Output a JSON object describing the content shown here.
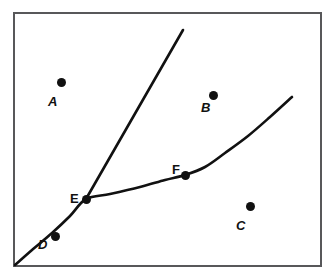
{
  "figure": {
    "name": "labeled-points-two-curves-diagram",
    "background_color": "#ffffff",
    "frame_color": "#58585a",
    "ink_color": "#111111",
    "top_clipped_text": "· · ·",
    "frame": {
      "x": 13,
      "y": 12,
      "width": 309,
      "height": 255
    }
  },
  "chart_data": {
    "type": "line",
    "title": "",
    "xlabel": "",
    "ylabel": "",
    "grid": false,
    "legend": "none",
    "series": [
      {
        "name": "lower-branch-curve",
        "comment": "rises from bottom-left corner through D and E, then bends right through F toward upper right",
        "points": [
          [
            15,
            265
          ],
          [
            32,
            250
          ],
          [
            52,
            233
          ],
          [
            70,
            216
          ],
          [
            86,
            199
          ],
          [
            110,
            194
          ],
          [
            140,
            187
          ],
          [
            165,
            180
          ],
          [
            185,
            175
          ],
          [
            205,
            167
          ],
          [
            225,
            153
          ],
          [
            248,
            136
          ],
          [
            270,
            117
          ],
          [
            292,
            97
          ]
        ]
      },
      {
        "name": "upper-straight-line",
        "comment": "steep straight line passing through E and continuing to upper area",
        "points": [
          [
            86,
            199
          ],
          [
            183,
            30
          ]
        ]
      }
    ],
    "annotations": [
      {
        "id": "A",
        "label": "A",
        "label_style": "italic",
        "label_x": 48,
        "label_y": 95,
        "dot_x": 61,
        "dot_y": 82,
        "on_curve": false
      },
      {
        "id": "B",
        "label": "B",
        "label_style": "italic",
        "label_x": 201,
        "label_y": 101,
        "dot_x": 213,
        "dot_y": 95,
        "on_curve": false
      },
      {
        "id": "C",
        "label": "C",
        "label_style": "italic",
        "label_x": 236,
        "label_y": 219,
        "dot_x": 250,
        "dot_y": 206,
        "on_curve": false
      },
      {
        "id": "D",
        "label": "D",
        "label_style": "italic",
        "label_x": 38,
        "label_y": 238,
        "dot_x": 55,
        "dot_y": 236,
        "on_curve": true
      },
      {
        "id": "E",
        "label": "E",
        "label_style": "upright",
        "label_x": 70,
        "label_y": 192,
        "dot_x": 86,
        "dot_y": 199,
        "on_curve": true
      },
      {
        "id": "F",
        "label": "F",
        "label_style": "upright",
        "label_x": 172,
        "label_y": 163,
        "dot_x": 185,
        "dot_y": 175,
        "on_curve": true
      }
    ]
  }
}
